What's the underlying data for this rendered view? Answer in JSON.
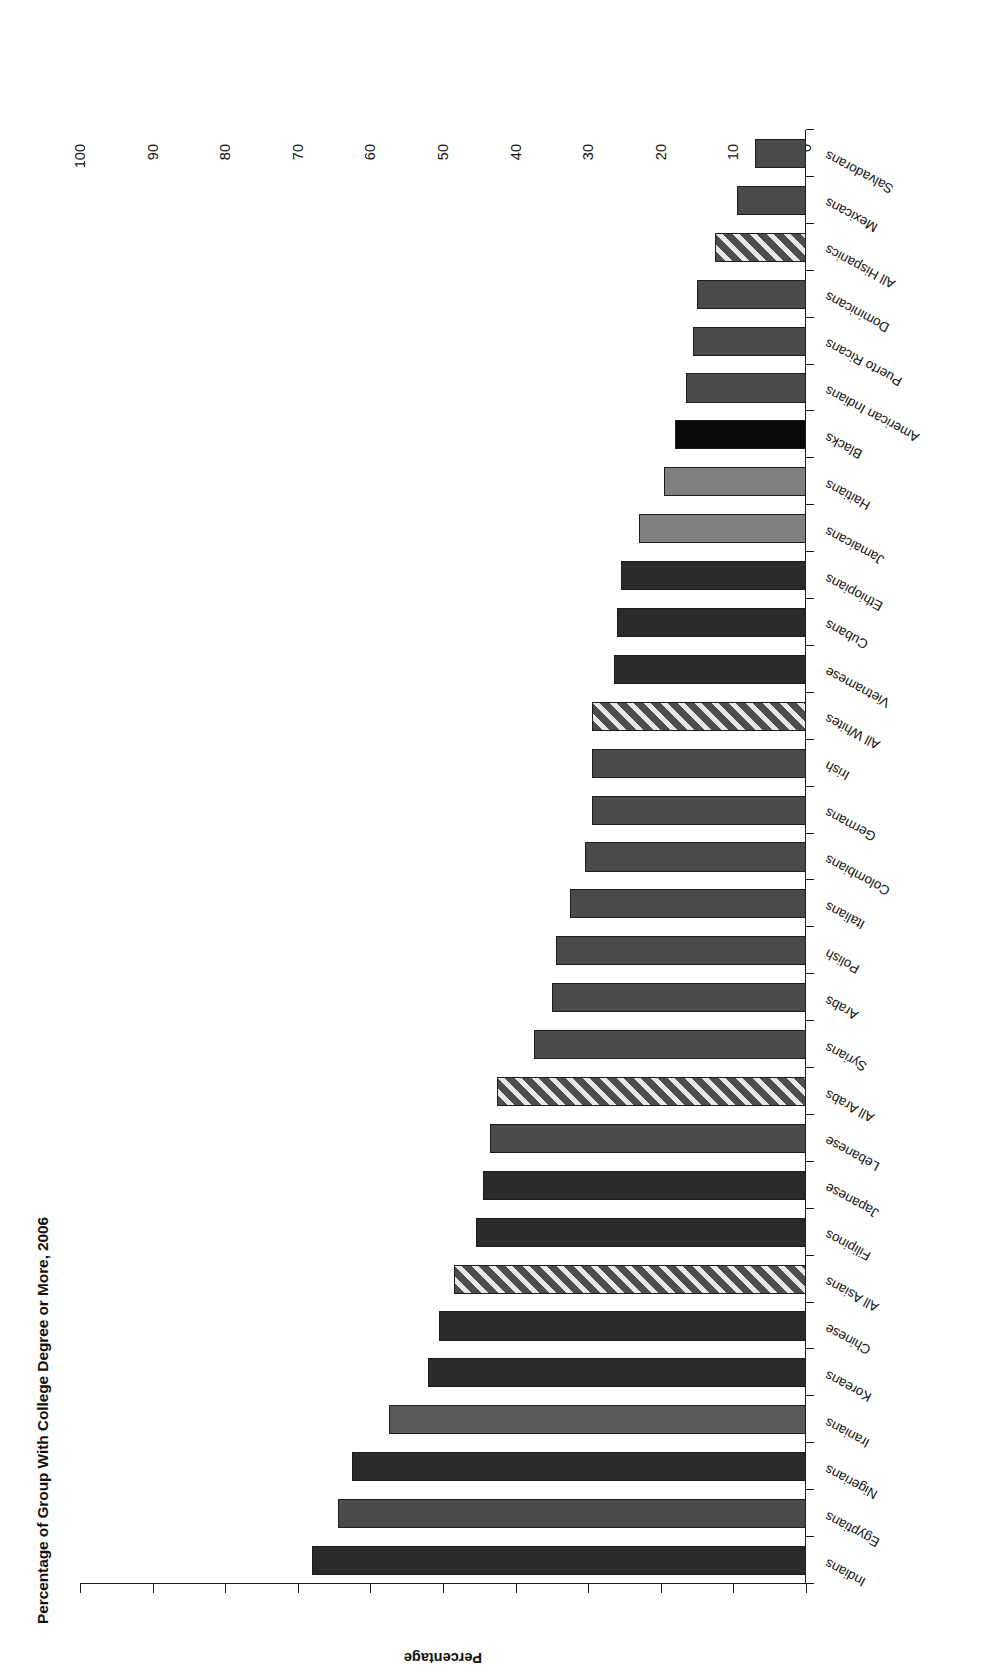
{
  "chart_data": {
    "type": "bar",
    "orientation": "vertical-rotated",
    "title": "Percentage of Group With College Degree or More, 2006",
    "xlabel": "",
    "ylabel": "Percentage",
    "ylim": [
      0,
      100
    ],
    "ytick_values": [
      0,
      10,
      20,
      30,
      40,
      50,
      60,
      70,
      80,
      90,
      100
    ],
    "ytick_labels": [
      "0",
      "10",
      "20",
      "30",
      "40",
      "50",
      "60",
      "70",
      "80",
      "90",
      "100"
    ],
    "grid": false,
    "legend": "none",
    "categories": [
      "Indians",
      "Egyptians",
      "Nigerians",
      "Iranians",
      "Koreans",
      "Chinese",
      "All Asians",
      "Filipinos",
      "Japanese",
      "Lebanese",
      "All Arabs",
      "Syrians",
      "Arabs",
      "Polish",
      "Italians",
      "Colombians",
      "Germans",
      "Irish",
      "All Whites",
      "Vietnamese",
      "Cubans",
      "Ethiopians",
      "Jamaicans",
      "Haitians",
      "Blacks",
      "American Indians",
      "Puerto Ricans",
      "Dominicans",
      "All Hispanics",
      "Mexicans",
      "Salvadorans"
    ],
    "values": [
      68.0,
      64.5,
      62.5,
      57.5,
      52.0,
      50.5,
      48.5,
      45.5,
      44.5,
      43.5,
      42.5,
      37.5,
      35.0,
      34.5,
      32.5,
      30.5,
      29.5,
      29.5,
      29.5,
      26.5,
      26.0,
      25.5,
      23.0,
      19.5,
      18.0,
      16.5,
      15.5,
      15.0,
      12.5,
      9.5,
      7.0
    ],
    "bar_styles": [
      "dark",
      "mid",
      "dark",
      "light-mid",
      "dark",
      "dark",
      "hatch",
      "dark",
      "dark",
      "mid",
      "hatch",
      "mid",
      "mid",
      "mid",
      "mid",
      "mid",
      "mid",
      "mid",
      "hatch",
      "dark",
      "dark",
      "dark",
      "light",
      "light",
      "black",
      "mid",
      "mid",
      "mid",
      "hatch",
      "mid",
      "mid"
    ]
  },
  "colors": {
    "axis": "#1a1a1a",
    "text": "#111111",
    "background": "#ffffff",
    "bar_black": "#080808",
    "bar_dark": "#2b2b2b",
    "bar_mid": "#4a4a4a",
    "bar_light_mid": "#595959",
    "bar_light": "#808080",
    "bar_hatch_base": "#4d4d4d"
  }
}
